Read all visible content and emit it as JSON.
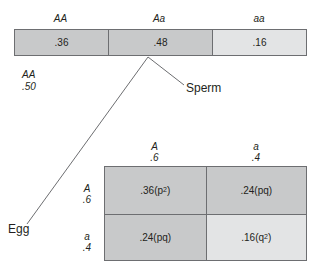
{
  "figure": {
    "genotype_bar": {
      "headers": [
        {
          "label": "AA"
        },
        {
          "label": "Aa"
        },
        {
          "label": "aa"
        }
      ],
      "cells": [
        {
          "value": ".36",
          "shade": "#c8c9ca"
        },
        {
          "value": ".48",
          "shade": "#c8c9ca"
        },
        {
          "value": ".16",
          "shade": "#e3e4e5"
        }
      ]
    },
    "left_note": {
      "genotype": "AA",
      "frequency": ".50"
    },
    "annotations": {
      "sperm": "Sperm",
      "egg": "Egg"
    },
    "punnett": {
      "column_headers": [
        {
          "allele": "A",
          "freq": ".6"
        },
        {
          "allele": "a",
          "freq": ".4"
        }
      ],
      "row_headers": [
        {
          "allele": "A",
          "freq": ".6"
        },
        {
          "allele": "a",
          "freq": ".4"
        }
      ],
      "cells": [
        {
          "value": ".36",
          "term": "p",
          "exp": "2",
          "paren_open": " (",
          "paren_close": ")",
          "shade": "#c8c9ca"
        },
        {
          "value": ".24",
          "term": "pq",
          "exp": "",
          "paren_open": " (",
          "paren_close": ")",
          "shade": "#c8c9ca"
        },
        {
          "value": ".24",
          "term": "pq",
          "exp": "",
          "paren_open": " (",
          "paren_close": ")",
          "shade": "#c8c9ca"
        },
        {
          "value": ".16",
          "term": "q",
          "exp": "2",
          "paren_open": " (",
          "paren_close": ")",
          "shade": "#e3e4e5"
        }
      ]
    },
    "colors": {
      "stroke": "#6d6e71",
      "text": "#231f20",
      "shade_mid": "#c8c9ca",
      "shade_light": "#e3e4e5"
    }
  }
}
